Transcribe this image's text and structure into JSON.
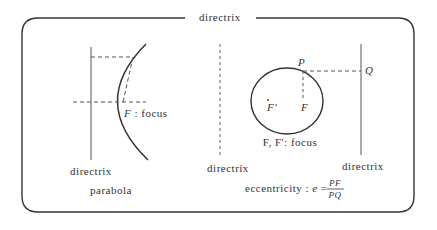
{
  "frame": {
    "title": "directrix"
  },
  "parabola": {
    "focus_label_letter": "F",
    "focus_label_text": " : focus",
    "directrix_label": "directrix",
    "caption": "parabola"
  },
  "ellipse": {
    "point_p": "P",
    "point_q": "Q",
    "focus_f": "F",
    "focus_f_prime": "F'",
    "focus_caption": "F, F': focus",
    "left_directrix_label": "directrix",
    "right_directrix_label": "directrix",
    "eccentricity_label": "eccentricity : ",
    "eccentricity_symbol": "e",
    "equals": "=",
    "numerator": "PF",
    "denominator": "PQ"
  },
  "colors": {
    "stroke": "#333333",
    "dashed": "#555555",
    "background": "#ffffff"
  }
}
